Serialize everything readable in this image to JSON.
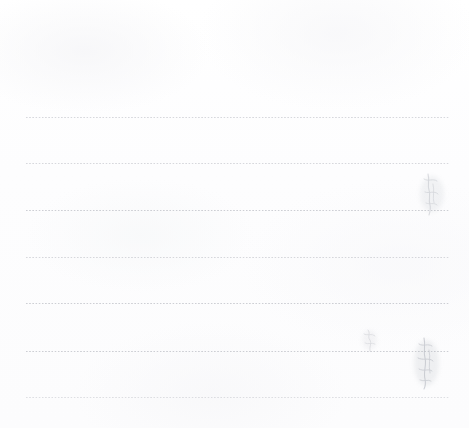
{
  "document": {
    "kind": "scanned-lined-paper",
    "title": "Blank ruled notepaper scan",
    "width_px": 469,
    "height_px": 428,
    "background_color": "#fdfdfd",
    "rule_color": "#b0b2ba",
    "ink_color": "#b9bcc4",
    "visible_text": "",
    "alt_text": "A blank scanned sheet of ruled notepaper with seven faint dotted horizontal lines and a few very faint pencil marks near the right edge."
  },
  "rules": {
    "count": 7,
    "left_px": 26,
    "right_px": 450,
    "spacing_px": 46.5,
    "items": [
      {
        "index": 1,
        "y_px": 117,
        "weight": "medium"
      },
      {
        "index": 2,
        "y_px": 163,
        "weight": "medium"
      },
      {
        "index": 3,
        "y_px": 210,
        "weight": "dense"
      },
      {
        "index": 4,
        "y_px": 257,
        "weight": "medium"
      },
      {
        "index": 5,
        "y_px": 303,
        "weight": "dense"
      },
      {
        "index": 6,
        "y_px": 351,
        "weight": "dense"
      },
      {
        "index": 7,
        "y_px": 397,
        "weight": "faint"
      }
    ]
  },
  "marks": [
    {
      "id": "mark-upper-right",
      "description": "faint pencil scribble crossing the third rule",
      "x_px": 420,
      "y_px": 172,
      "width_px": 26,
      "height_px": 44,
      "color": "#c2c4cb"
    },
    {
      "id": "mark-mid-right-small",
      "description": "small faint pencil character above the sixth rule",
      "x_px": 362,
      "y_px": 328,
      "width_px": 16,
      "height_px": 24,
      "color": "#c7c9cf"
    },
    {
      "id": "mark-lower-right",
      "description": "faint pencil scribble crossing the sixth rule",
      "x_px": 414,
      "y_px": 336,
      "width_px": 26,
      "height_px": 54,
      "color": "#b4b7c0"
    }
  ]
}
